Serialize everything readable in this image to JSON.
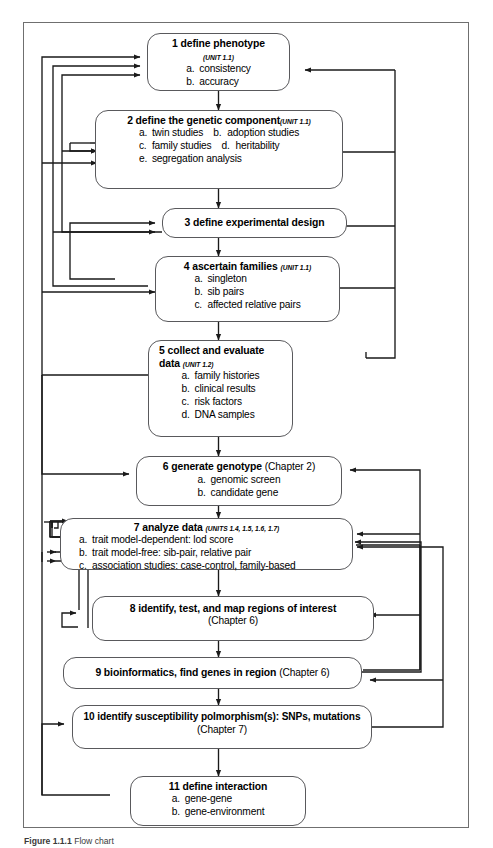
{
  "figure": {
    "type": "flowchart",
    "orientation": "vertical-top-to-bottom",
    "frame_border_color": "#6f6f6f",
    "node_border_color": "#59595c",
    "wire_color": "#1a1a1a",
    "background": "#ffffff",
    "caption_prefix": "Figure 1.1.1",
    "caption_rest": "Flow chart"
  },
  "nodes": [
    {
      "id": "n1",
      "number": "1",
      "title": "1 define phenotype",
      "unit": "(UNIT 1.1)",
      "unit_position": "below-title",
      "items": [
        {
          "label": "a.",
          "text": "consistency"
        },
        {
          "label": "b.",
          "text": "accuracy"
        }
      ]
    },
    {
      "id": "n2",
      "number": "2",
      "title": "2 define the genetic component",
      "unit": "(UNIT 1.1)",
      "unit_position": "inline",
      "items": [
        {
          "label": "a.",
          "text": "twin studies",
          "label2": "b.",
          "text2": "adoption studies"
        },
        {
          "label": "c.",
          "text": "family studies",
          "label2": "d.",
          "text2": "heritability"
        },
        {
          "label": "e.",
          "text": "segregation analysis"
        }
      ]
    },
    {
      "id": "n3",
      "number": "3",
      "title": "3 define experimental design",
      "unit": "",
      "items": []
    },
    {
      "id": "n4",
      "number": "4",
      "title": "4 ascertain families",
      "unit": "(UNIT 1.1)",
      "unit_position": "inline",
      "items": [
        {
          "label": "a.",
          "text": "singleton"
        },
        {
          "label": "b.",
          "text": "sib pairs"
        },
        {
          "label": "c.",
          "text": "affected relative pairs"
        }
      ]
    },
    {
      "id": "n5",
      "number": "5",
      "title": "5 collect and evaluate",
      "title_line2": "data",
      "unit": "(UNIT 1.2)",
      "unit_position": "inline-line2",
      "items": [
        {
          "label": "a.",
          "text": "family histories"
        },
        {
          "label": "b.",
          "text": "clinical results"
        },
        {
          "label": "c.",
          "text": "risk factors"
        },
        {
          "label": "d.",
          "text": "DNA samples"
        }
      ]
    },
    {
      "id": "n6",
      "number": "6",
      "title": "6 generate genotype",
      "chapter": "(Chapter 2)",
      "items": [
        {
          "label": "a.",
          "text": "genomic screen"
        },
        {
          "label": "b.",
          "text": "candidate gene"
        }
      ]
    },
    {
      "id": "n7",
      "number": "7",
      "title": "7 analyze data",
      "unit": "(UNITS 1.4, 1.5, 1.6, 1.7)",
      "unit_position": "inline",
      "items": [
        {
          "label": "a.",
          "text": "trait model-dependent: lod score"
        },
        {
          "label": "b.",
          "text": "trait model-free: sib-pair, relative pair"
        },
        {
          "label": "c.",
          "text": "association studies: case-control, family-based"
        }
      ]
    },
    {
      "id": "n8",
      "number": "8",
      "title": "8 identify, test, and map regions of interest",
      "chapter": "(Chapter 6)",
      "chapter_position": "second-line",
      "items": []
    },
    {
      "id": "n9",
      "number": "9",
      "title": "9 bioinformatics, find genes in region",
      "chapter": "(Chapter 6)",
      "chapter_position": "inline",
      "items": []
    },
    {
      "id": "n10",
      "number": "10",
      "title": "10 identify susceptibility polmorphism(s): SNPs, mutations",
      "chapter": "(Chapter 7)",
      "chapter_position": "second-line",
      "items": []
    },
    {
      "id": "n11",
      "number": "11",
      "title": "11 define interaction",
      "items": [
        {
          "label": "a.",
          "text": "gene-gene"
        },
        {
          "label": "b.",
          "text": "gene-environment"
        }
      ]
    }
  ],
  "flow_main": [
    "n1",
    "n2",
    "n3",
    "n4",
    "n5",
    "n6",
    "n7",
    "n8",
    "n9",
    "n10",
    "n11"
  ],
  "feedback_edges": [
    {
      "from": "n3",
      "to": "n1",
      "side": "left"
    },
    {
      "from": "n4",
      "to": "n1",
      "side": "left"
    },
    {
      "from": "n5",
      "to": "n1",
      "side": "left"
    },
    {
      "from": "n2",
      "to": "n2",
      "side": "left"
    },
    {
      "from": "n7",
      "to": "n2",
      "side": "left"
    },
    {
      "from": "n4",
      "to": "n3",
      "side": "left"
    },
    {
      "from": "n5",
      "to": "n4",
      "side": "left"
    },
    {
      "from": "n7",
      "to": "n6",
      "side": "left"
    },
    {
      "from": "n7",
      "to": "n7",
      "side": "left"
    },
    {
      "from": "n8",
      "to": "n7",
      "side": "left"
    },
    {
      "from": "n8",
      "to": "n8",
      "side": "left"
    },
    {
      "from": "n11",
      "to": "n10",
      "side": "left"
    },
    {
      "from": "n9",
      "to": "n6",
      "side": "right"
    },
    {
      "from": "n9",
      "to": "n7",
      "side": "right"
    },
    {
      "from": "n9",
      "to": "n8",
      "side": "right"
    },
    {
      "from": "n10",
      "to": "n9",
      "side": "right"
    },
    {
      "from": "n10",
      "to": "n7",
      "side": "right"
    }
  ]
}
